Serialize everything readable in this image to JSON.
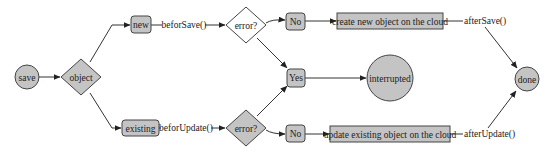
{
  "diagram": {
    "type": "flowchart",
    "colors": {
      "node_fill": "#c4c4c4",
      "node_stroke": "#444444",
      "edge": "#333333",
      "background": "#ffffff"
    },
    "nodes": {
      "save": {
        "label": "save",
        "shape": "circle"
      },
      "object": {
        "label": "object",
        "shape": "diamond"
      },
      "new": {
        "label": "new",
        "shape": "rounded-rect"
      },
      "existing": {
        "label": "existing",
        "shape": "rounded-rect"
      },
      "error_top": {
        "label": "error?",
        "shape": "diamond"
      },
      "error_bottom": {
        "label": "error?",
        "shape": "diamond"
      },
      "no_top": {
        "label": "No",
        "shape": "rounded-rect"
      },
      "no_bottom": {
        "label": "No",
        "shape": "rounded-rect"
      },
      "yes": {
        "label": "Yes",
        "shape": "rounded-rect"
      },
      "create": {
        "label": "create new object on the cloud",
        "shape": "rect"
      },
      "update": {
        "label": "update existing object on the cloud",
        "shape": "rect"
      },
      "interrupted": {
        "label": "interrupted",
        "shape": "circle"
      },
      "done": {
        "label": "done",
        "shape": "circle"
      }
    },
    "edge_labels": {
      "before_save": "beforSave()",
      "before_update": "beforUpdate()",
      "after_save": "afterSave()",
      "after_update": "afterUpdate()"
    }
  }
}
